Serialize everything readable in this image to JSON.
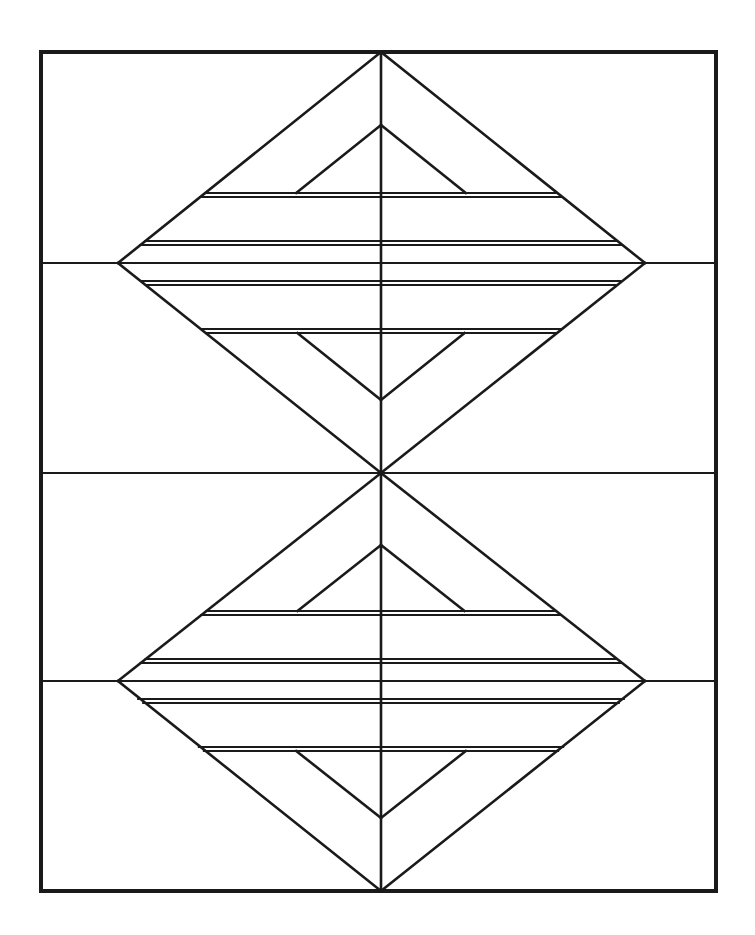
{
  "document": {
    "title": "Two Stacked Subdivided Diamonds",
    "description": "Black-and-white geometric line drawing: a rectangular border frame containing two vertically stacked diamond (rhombus) figures, each internally subdivided by horizontal bands and nested triangles, joined at a common center point.",
    "background_color": "#ffffff",
    "ink_color": "#1a1a1a"
  },
  "canvas": {
    "width": 755,
    "height": 935
  },
  "frame": {
    "name": "outer-border",
    "x": 41,
    "y": 52,
    "width": 675,
    "height": 839,
    "stroke_width": 4,
    "stroke_color": "#1a1a1a"
  },
  "geometry": {
    "center_x": 381,
    "left_vertex_x": 118,
    "right_vertex_x": 645,
    "frame_left": 41,
    "frame_right": 716,
    "frame_top": 52,
    "frame_bottom": 891,
    "line_width": 2.6,
    "thin_line_width": 2.2,
    "stroke_color": "#1a1a1a"
  },
  "diamonds": [
    {
      "name": "upper-diamond",
      "apex_y": 52,
      "waist_y": 263,
      "bottom_y": 473,
      "inner_apex_y": 125,
      "inner_bottom_y": 400,
      "band_lines_upper": [
        193,
        197,
        241,
        245
      ],
      "band_lines_lower": [
        281,
        285,
        329,
        333
      ]
    },
    {
      "name": "lower-diamond",
      "apex_y": 473,
      "waist_y": 681,
      "bottom_y": 891,
      "inner_apex_y": 545,
      "inner_bottom_y": 818,
      "band_lines_upper": [
        611,
        615,
        659,
        663
      ],
      "band_lines_lower": [
        699,
        703,
        747,
        751
      ]
    }
  ],
  "full_width_rules": [
    {
      "name": "upper-waist-rule",
      "y": 263
    },
    {
      "name": "center-rule",
      "y": 473
    },
    {
      "name": "lower-waist-rule",
      "y": 681
    }
  ],
  "chart_data": {
    "type": "diagram",
    "elements": [
      "outer rectangular frame",
      "upper diamond with nested triangles and horizontal bands",
      "lower diamond with nested triangles and horizontal bands",
      "vertical center axis",
      "three full-width horizontal rules"
    ]
  }
}
